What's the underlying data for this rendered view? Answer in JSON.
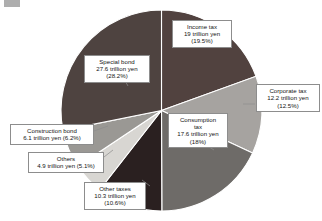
{
  "chart_data": {
    "type": "pie",
    "title": "",
    "units": "trillion yen",
    "total": 97.7,
    "start_angle_deg": 0,
    "direction": "clockwise",
    "legend": "callout-labels",
    "categories": [
      "Income tax",
      "Corporate tax",
      "Consumption tax",
      "Other taxes",
      "Others",
      "Construction bond",
      "Special bond"
    ],
    "values": [
      19,
      12.2,
      17.6,
      10.3,
      4.9,
      6.1,
      27.6
    ],
    "percents": [
      19.5,
      12.5,
      18,
      10.6,
      5.1,
      6.2,
      28.2
    ],
    "colors": [
      "#51423f",
      "#a6a3a0",
      "#6e6b68",
      "#2a2020",
      "#d8d6d2",
      "#9a9894",
      "#4e4340"
    ],
    "slices": [
      {
        "name": "Income tax",
        "value": 19,
        "percent": 19.5,
        "color": "#51423f",
        "label_lines": [
          "Income tax",
          "19 trillion yen",
          "(19.5%)"
        ]
      },
      {
        "name": "Corporate tax",
        "value": 12.2,
        "percent": 12.5,
        "color": "#a6a3a0",
        "label_lines": [
          "Corporate tax",
          "12.2 trillion yen",
          "(12.5%)"
        ]
      },
      {
        "name": "Consumption tax",
        "value": 17.6,
        "percent": 18,
        "color": "#6e6b68",
        "label_lines": [
          "Consumption",
          "tax",
          "17.6 trillion yen",
          "(18%)"
        ]
      },
      {
        "name": "Other taxes",
        "value": 10.3,
        "percent": 10.6,
        "color": "#2a2020",
        "label_lines": [
          "Other taxes",
          "10.3 trillion yen",
          "(10.6%)"
        ]
      },
      {
        "name": "Others",
        "value": 4.9,
        "percent": 5.1,
        "color": "#d8d6d2",
        "label_lines": [
          "Others",
          "4.9 trillion yen (5.1%)"
        ]
      },
      {
        "name": "Construction bond",
        "value": 6.1,
        "percent": 6.2,
        "color": "#9a9894",
        "label_lines": [
          "Construction bond",
          "6.1 trillion yen (6.2%)"
        ]
      },
      {
        "name": "Special bond",
        "value": 27.6,
        "percent": 28.2,
        "color": "#4e4340",
        "label_lines": [
          "Special bond",
          "27.6 trillion yen",
          "(28.2%)"
        ]
      }
    ]
  },
  "labels": {
    "income": {
      "l1": "Income tax",
      "l2": "19 trillion yen",
      "l3": "(19.5%)"
    },
    "corporate": {
      "l1": "Corporate tax",
      "l2": "12.2 trillion yen",
      "l3": "(12.5%)"
    },
    "consumption": {
      "l1": "Consumption",
      "l2": "tax",
      "l3": "17.6 trillion yen",
      "l4": "(18%)"
    },
    "othertaxes": {
      "l1": "Other taxes",
      "l2": "10.3 trillion yen",
      "l3": "(10.6%)"
    },
    "others": {
      "l1": "Others",
      "l2": "4.9 trillion yen (5.1%)"
    },
    "construction": {
      "l1": "Construction bond",
      "l2": "6.1 trillion yen (6.2%)"
    },
    "special": {
      "l1": "Special bond",
      "l2": "27.6 trillion yen",
      "l3": "(28.2%)"
    }
  }
}
